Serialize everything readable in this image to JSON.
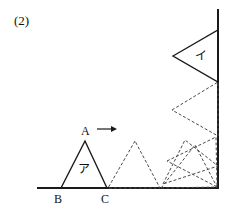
{
  "problem": {
    "number_label": "(2)"
  },
  "labels": {
    "vertex_a": "A",
    "vertex_b": "B",
    "vertex_c": "C",
    "triangle_start": "ア",
    "triangle_end": "イ"
  },
  "chart_data": {
    "type": "diagram",
    "title": "(2)",
    "xlim": [
      0,
      229
    ],
    "ylim": [
      0,
      209
    ],
    "grid": false,
    "legend": null,
    "axes": {
      "baseline": {
        "x1": 38,
        "y1": 188,
        "x2": 218,
        "y2": 188,
        "style": "solid",
        "width": 2
      },
      "wall": {
        "x1": 218,
        "y1": 10,
        "x2": 218,
        "y2": 188,
        "style": "solid",
        "width": 2
      }
    },
    "solid_triangles": [
      {
        "name": "ア",
        "points": [
          [
            85,
            141
          ],
          [
            61,
            188
          ],
          [
            107,
            188
          ]
        ],
        "label_pos": [
          85,
          171
        ],
        "vertex_labels": [
          {
            "text": "A",
            "x": 85,
            "y": 132
          },
          {
            "text": "B",
            "x": 59,
            "y": 200
          },
          {
            "text": "C",
            "x": 106,
            "y": 200
          }
        ]
      },
      {
        "name": "イ",
        "points": [
          [
            173,
            56
          ],
          [
            218,
            30
          ],
          [
            218,
            82
          ]
        ],
        "label_pos": [
          201,
          58
        ]
      }
    ],
    "dashed_triangles": [
      {
        "points": [
          [
            135,
            141
          ],
          [
            108,
            188
          ],
          [
            160,
            188
          ]
        ]
      },
      {
        "points": [
          [
            172,
            110
          ],
          [
            218,
            82
          ],
          [
            218,
            136
          ]
        ]
      },
      {
        "points": [
          [
            163,
            184
          ],
          [
            185,
            140
          ],
          [
            218,
            166
          ]
        ]
      },
      {
        "points": [
          [
            161,
            188
          ],
          [
            195,
            145
          ],
          [
            217,
            187
          ]
        ]
      },
      {
        "points": [
          [
            167,
            161
          ],
          [
            216,
            137
          ],
          [
            217,
            187
          ]
        ]
      }
    ],
    "arrow": {
      "x1": 97,
      "y1": 129,
      "x2": 117,
      "y2": 129,
      "direction": "right",
      "style": "solid"
    },
    "style": {
      "stroke_solid": "#1a1a1a",
      "stroke_dashed": "#4a4a4a",
      "dash_pattern": "3,2",
      "background": "#ffffff"
    }
  }
}
